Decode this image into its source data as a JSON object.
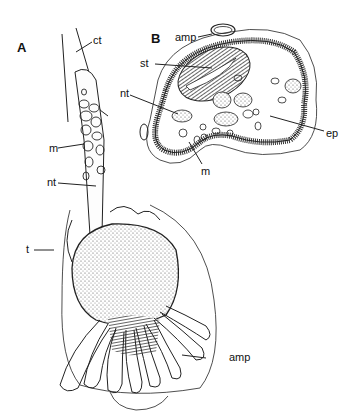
{
  "figure": {
    "panels": [
      {
        "id": "A",
        "label": "A"
      },
      {
        "id": "B",
        "label": "B"
      }
    ],
    "labels": {
      "a_ct": "ct",
      "a_m": "m",
      "a_nt": "nt",
      "a_t": "t",
      "a_amp": "amp",
      "b_amp": "amp",
      "b_st": "st",
      "b_nt": "nt",
      "b_ep": "ep",
      "b_m": "m"
    }
  }
}
